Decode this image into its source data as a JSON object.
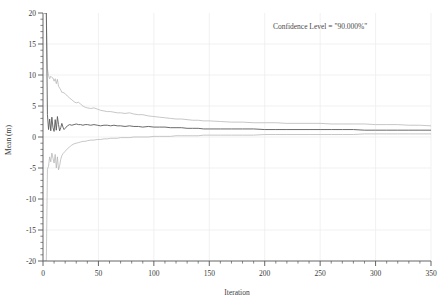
{
  "chart_data": {
    "type": "line",
    "title": "",
    "xlabel": "Iteration",
    "ylabel": "Mean (m)",
    "xlim": [
      0,
      350
    ],
    "ylim": [
      -20,
      20
    ],
    "grid": true,
    "x_major_ticks": [
      0,
      50,
      100,
      150,
      200,
      250,
      300,
      350
    ],
    "x_minor_interval": 10,
    "y_major_ticks": [
      -20,
      -15,
      -10,
      -5,
      0,
      5,
      10,
      15,
      20
    ],
    "y_minor_interval": 1,
    "x_tick_labels": [
      "0",
      "50",
      "100",
      "150",
      "200",
      "250",
      "300",
      "350"
    ],
    "y_tick_labels": [
      "20",
      "15",
      "10",
      "5",
      "0",
      "-5",
      "-10",
      "-15",
      "-20"
    ],
    "legend_position": "none",
    "annotations": [
      {
        "name": "confidence-level-annotation",
        "text": "Confidence Level = \"90.000%\"",
        "x": 250,
        "y": 17.5
      }
    ],
    "colors": {
      "mean_line": "#5a5a5a",
      "bound_line": "#b4b4b4",
      "axis": "#555555",
      "grid": "#ededed",
      "text": "#3a3a3a"
    },
    "series": [
      {
        "name": "Upper Confidence Bound",
        "color": "#b4b4b4",
        "x": [
          1,
          2,
          3,
          4,
          5,
          6,
          7,
          8,
          9,
          10,
          11,
          12,
          13,
          14,
          15,
          16,
          17,
          18,
          19,
          20,
          22,
          24,
          26,
          28,
          30,
          32,
          34,
          36,
          38,
          40,
          43,
          46,
          49,
          52,
          55,
          58,
          61,
          64,
          67,
          70,
          74,
          78,
          82,
          86,
          90,
          95,
          100,
          105,
          110,
          115,
          120,
          125,
          130,
          135,
          140,
          145,
          150,
          160,
          170,
          180,
          190,
          200,
          210,
          220,
          230,
          240,
          250,
          260,
          270,
          280,
          290,
          300,
          310,
          320,
          330,
          340,
          350
        ],
        "values": [
          20,
          20,
          20,
          11.0,
          9.9,
          9.4,
          9.8,
          9.6,
          9.5,
          9.0,
          9.4,
          8.6,
          9.3,
          8.2,
          7.9,
          7.6,
          7.2,
          7.2,
          7.1,
          7.0,
          6.6,
          6.3,
          6.0,
          5.7,
          5.5,
          5.6,
          5.3,
          5.0,
          4.8,
          4.7,
          4.6,
          4.7,
          4.5,
          4.3,
          4.2,
          4.1,
          4.1,
          4.0,
          3.9,
          3.9,
          3.8,
          3.9,
          3.7,
          3.6,
          3.6,
          3.4,
          3.3,
          3.2,
          3.1,
          3.0,
          2.9,
          2.9,
          2.8,
          2.7,
          2.7,
          2.6,
          2.6,
          2.5,
          2.4,
          2.4,
          2.3,
          2.3,
          2.3,
          2.2,
          2.2,
          2.2,
          2.2,
          2.1,
          2.1,
          2.1,
          2.1,
          2.0,
          2.0,
          2.0,
          1.9,
          1.9,
          1.8
        ]
      },
      {
        "name": "Mean",
        "color": "#5a5a5a",
        "x": [
          1,
          2,
          3,
          4,
          5,
          6,
          7,
          8,
          9,
          10,
          11,
          12,
          13,
          14,
          15,
          16,
          17,
          18,
          19,
          20,
          22,
          24,
          26,
          28,
          30,
          32,
          34,
          36,
          38,
          40,
          43,
          46,
          49,
          52,
          55,
          58,
          61,
          64,
          67,
          70,
          74,
          78,
          82,
          86,
          90,
          95,
          100,
          105,
          110,
          115,
          120,
          125,
          130,
          135,
          140,
          145,
          150,
          160,
          170,
          180,
          190,
          200,
          210,
          220,
          230,
          240,
          250,
          260,
          270,
          280,
          290,
          300,
          310,
          320,
          330,
          340,
          350
        ],
        "values": [
          20,
          20,
          20,
          3.6,
          1.2,
          2.9,
          1.0,
          3.2,
          1.5,
          0.9,
          2.8,
          1.1,
          3.3,
          2.0,
          1.0,
          1.5,
          2.2,
          1.6,
          1.2,
          1.4,
          1.8,
          2.0,
          1.9,
          2.0,
          2.1,
          2.0,
          2.0,
          1.9,
          2.0,
          2.0,
          1.9,
          2.0,
          1.9,
          1.8,
          1.9,
          1.9,
          1.8,
          1.9,
          1.8,
          1.8,
          1.7,
          1.8,
          1.7,
          1.7,
          1.6,
          1.7,
          1.6,
          1.6,
          1.6,
          1.5,
          1.5,
          1.5,
          1.4,
          1.4,
          1.4,
          1.3,
          1.3,
          1.3,
          1.3,
          1.3,
          1.3,
          1.2,
          1.2,
          1.2,
          1.2,
          1.2,
          1.2,
          1.2,
          1.2,
          1.2,
          1.1,
          1.1,
          1.1,
          1.1,
          1.1,
          1.1,
          1.1
        ]
      },
      {
        "name": "Lower Confidence Bound",
        "color": "#b4b4b4",
        "x": [
          1,
          2,
          3,
          4,
          5,
          6,
          7,
          8,
          9,
          10,
          11,
          12,
          13,
          14,
          15,
          16,
          17,
          18,
          19,
          20,
          22,
          24,
          26,
          28,
          30,
          32,
          34,
          36,
          38,
          40,
          43,
          46,
          49,
          52,
          55,
          58,
          61,
          64,
          67,
          70,
          74,
          78,
          82,
          86,
          90,
          95,
          100,
          105,
          110,
          115,
          120,
          125,
          130,
          135,
          140,
          145,
          150,
          160,
          170,
          180,
          190,
          200,
          210,
          220,
          230,
          240,
          250,
          260,
          270,
          280,
          290,
          300,
          310,
          320,
          330,
          340,
          350
        ],
        "values": [
          -20,
          -20,
          -20,
          -5.2,
          -4.7,
          -3.2,
          -4.0,
          -2.6,
          -3.4,
          -4.2,
          -2.8,
          -5.0,
          -3.2,
          -5.3,
          -4.6,
          -3.6,
          -3.0,
          -2.7,
          -2.5,
          -2.3,
          -1.9,
          -1.6,
          -1.3,
          -1.1,
          -1.0,
          -0.9,
          -0.8,
          -0.7,
          -0.7,
          -0.6,
          -0.5,
          -0.5,
          -0.4,
          -0.4,
          -0.3,
          -0.3,
          -0.2,
          -0.2,
          -0.2,
          -0.1,
          -0.1,
          -0.1,
          0.0,
          0.0,
          0.0,
          0.0,
          0.1,
          0.1,
          0.1,
          0.1,
          0.2,
          0.2,
          0.2,
          0.2,
          0.2,
          0.3,
          0.3,
          0.3,
          0.3,
          0.3,
          0.3,
          0.4,
          0.4,
          0.4,
          0.4,
          0.4,
          0.4,
          0.4,
          0.4,
          0.4,
          0.5,
          0.5,
          0.5,
          0.5,
          0.5,
          0.5,
          0.5
        ]
      }
    ]
  }
}
